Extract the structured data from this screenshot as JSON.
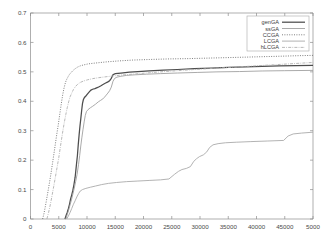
{
  "chart_data": {
    "type": "line",
    "title": "",
    "subtitle": "",
    "xlabel": "",
    "ylabel": "",
    "xlim": [
      0,
      50000
    ],
    "ylim": [
      0,
      0.7
    ],
    "grid": false,
    "legend_position": "top-right",
    "x_ticks": [
      0,
      5000,
      10000,
      15000,
      20000,
      25000,
      30000,
      35000,
      40000,
      45000,
      50000
    ],
    "x_tick_labels": [
      "0",
      "5000",
      "10000",
      "15000",
      "20000",
      "25000",
      "30000",
      "35000",
      "40000",
      "45000",
      "5000"
    ],
    "y_ticks": [
      0,
      0.1,
      0.2,
      0.3,
      0.4,
      0.5,
      0.6,
      0.7
    ],
    "y_tick_labels": [
      "0",
      "0.1",
      "0.2",
      "0.3",
      "0.4",
      "0.5",
      "0.6",
      "0.7"
    ],
    "series": [
      {
        "name": "genGA",
        "label": "genGA",
        "color": "#4d4d4d",
        "style": "solid",
        "width": 1.25,
        "dash": "",
        "points": [
          [
            6100,
            0.0
          ],
          [
            6300,
            0.012
          ],
          [
            6500,
            0.022
          ],
          [
            6700,
            0.035
          ],
          [
            6900,
            0.05
          ],
          [
            7100,
            0.068
          ],
          [
            7300,
            0.082
          ],
          [
            7500,
            0.098
          ],
          [
            7700,
            0.118
          ],
          [
            7900,
            0.142
          ],
          [
            8000,
            0.16
          ],
          [
            8150,
            0.188
          ],
          [
            8300,
            0.215
          ],
          [
            8450,
            0.252
          ],
          [
            8600,
            0.285
          ],
          [
            8750,
            0.315
          ],
          [
            8900,
            0.34
          ],
          [
            9050,
            0.368
          ],
          [
            9200,
            0.392
          ],
          [
            9350,
            0.405
          ],
          [
            9550,
            0.413
          ],
          [
            9800,
            0.418
          ],
          [
            10100,
            0.425
          ],
          [
            10400,
            0.432
          ],
          [
            10700,
            0.438
          ],
          [
            11000,
            0.441
          ],
          [
            11400,
            0.443
          ],
          [
            11900,
            0.447
          ],
          [
            12400,
            0.452
          ],
          [
            12900,
            0.458
          ],
          [
            13300,
            0.462
          ],
          [
            13700,
            0.466
          ],
          [
            14000,
            0.47
          ],
          [
            14300,
            0.478
          ],
          [
            14600,
            0.49
          ],
          [
            15000,
            0.494
          ],
          [
            16000,
            0.496
          ],
          [
            17500,
            0.499
          ],
          [
            19000,
            0.501
          ],
          [
            21000,
            0.503
          ],
          [
            23500,
            0.506
          ],
          [
            26000,
            0.508
          ],
          [
            29000,
            0.511
          ],
          [
            32000,
            0.513
          ],
          [
            35000,
            0.515
          ],
          [
            38000,
            0.517
          ],
          [
            41000,
            0.519
          ],
          [
            44000,
            0.52
          ],
          [
            47000,
            0.521
          ],
          [
            50000,
            0.522
          ]
        ]
      },
      {
        "name": "ssGA",
        "label": "ssGA",
        "color": "#9b9b9b",
        "style": "solid-thin",
        "width": 0.85,
        "dash": "",
        "points": [
          [
            6250,
            0.0
          ],
          [
            6500,
            0.015
          ],
          [
            6750,
            0.03
          ],
          [
            7000,
            0.048
          ],
          [
            7250,
            0.065
          ],
          [
            7500,
            0.085
          ],
          [
            7750,
            0.105
          ],
          [
            8000,
            0.128
          ],
          [
            8250,
            0.152
          ],
          [
            8500,
            0.185
          ],
          [
            8700,
            0.215
          ],
          [
            8900,
            0.248
          ],
          [
            9100,
            0.278
          ],
          [
            9300,
            0.305
          ],
          [
            9500,
            0.33
          ],
          [
            9700,
            0.352
          ],
          [
            9900,
            0.365
          ],
          [
            10200,
            0.372
          ],
          [
            10600,
            0.378
          ],
          [
            11000,
            0.383
          ],
          [
            11500,
            0.39
          ],
          [
            12000,
            0.398
          ],
          [
            12400,
            0.403
          ],
          [
            12800,
            0.408
          ],
          [
            13100,
            0.414
          ],
          [
            13400,
            0.421
          ],
          [
            13700,
            0.428
          ],
          [
            14000,
            0.436
          ],
          [
            14300,
            0.448
          ],
          [
            14600,
            0.468
          ],
          [
            14900,
            0.478
          ],
          [
            15300,
            0.482
          ],
          [
            16000,
            0.485
          ],
          [
            17000,
            0.488
          ],
          [
            18500,
            0.49
          ],
          [
            20500,
            0.492
          ],
          [
            23000,
            0.494
          ],
          [
            26000,
            0.496
          ],
          [
            29500,
            0.498
          ],
          [
            33000,
            0.5
          ],
          [
            37000,
            0.501
          ],
          [
            41000,
            0.503
          ],
          [
            45000,
            0.504
          ],
          [
            50000,
            0.505
          ]
        ]
      },
      {
        "name": "CCGA",
        "label": "CCGA",
        "color": "#707070",
        "style": "dotted",
        "width": 0.9,
        "dash": "1,1.4",
        "points": [
          [
            2150,
            0.0
          ],
          [
            2400,
            0.02
          ],
          [
            2650,
            0.045
          ],
          [
            2900,
            0.072
          ],
          [
            3150,
            0.1
          ],
          [
            3400,
            0.128
          ],
          [
            3650,
            0.158
          ],
          [
            3900,
            0.19
          ],
          [
            4150,
            0.222
          ],
          [
            4400,
            0.255
          ],
          [
            4650,
            0.288
          ],
          [
            4900,
            0.318
          ],
          [
            5100,
            0.345
          ],
          [
            5300,
            0.372
          ],
          [
            5500,
            0.398
          ],
          [
            5700,
            0.422
          ],
          [
            5900,
            0.442
          ],
          [
            6100,
            0.458
          ],
          [
            6300,
            0.47
          ],
          [
            6550,
            0.48
          ],
          [
            6850,
            0.49
          ],
          [
            7200,
            0.498
          ],
          [
            7600,
            0.506
          ],
          [
            8000,
            0.512
          ],
          [
            8400,
            0.517
          ],
          [
            8900,
            0.521
          ],
          [
            9500,
            0.524
          ],
          [
            10200,
            0.527
          ],
          [
            11000,
            0.529
          ],
          [
            12000,
            0.531
          ],
          [
            13500,
            0.534
          ],
          [
            15500,
            0.537
          ],
          [
            18000,
            0.54
          ],
          [
            21000,
            0.542
          ],
          [
            24500,
            0.544
          ],
          [
            28000,
            0.545
          ],
          [
            32000,
            0.547
          ],
          [
            36000,
            0.549
          ],
          [
            40000,
            0.551
          ],
          [
            44000,
            0.553
          ],
          [
            47500,
            0.555
          ],
          [
            50000,
            0.556
          ]
        ]
      },
      {
        "name": "LCGA",
        "label": "LCGA",
        "color": "#a5a5a5",
        "style": "solid-thin",
        "width": 0.85,
        "dash": "",
        "points": [
          [
            6400,
            0.0
          ],
          [
            6700,
            0.01
          ],
          [
            7000,
            0.022
          ],
          [
            7300,
            0.036
          ],
          [
            7600,
            0.05
          ],
          [
            7900,
            0.062
          ],
          [
            8200,
            0.075
          ],
          [
            8500,
            0.086
          ],
          [
            8800,
            0.095
          ],
          [
            9200,
            0.1
          ],
          [
            9800,
            0.104
          ],
          [
            10600,
            0.108
          ],
          [
            11500,
            0.112
          ],
          [
            12600,
            0.117
          ],
          [
            13800,
            0.121
          ],
          [
            15200,
            0.124
          ],
          [
            17000,
            0.127
          ],
          [
            19000,
            0.129
          ],
          [
            21000,
            0.131
          ],
          [
            23000,
            0.133
          ],
          [
            24500,
            0.136
          ],
          [
            25500,
            0.152
          ],
          [
            26200,
            0.162
          ],
          [
            26800,
            0.168
          ],
          [
            27600,
            0.172
          ],
          [
            28300,
            0.178
          ],
          [
            28900,
            0.196
          ],
          [
            29400,
            0.205
          ],
          [
            29900,
            0.212
          ],
          [
            30600,
            0.218
          ],
          [
            31200,
            0.228
          ],
          [
            31700,
            0.243
          ],
          [
            32300,
            0.252
          ],
          [
            33200,
            0.256
          ],
          [
            34500,
            0.259
          ],
          [
            36500,
            0.261
          ],
          [
            39000,
            0.263
          ],
          [
            42000,
            0.265
          ],
          [
            44800,
            0.267
          ],
          [
            45600,
            0.282
          ],
          [
            46500,
            0.289
          ],
          [
            48000,
            0.292
          ],
          [
            50000,
            0.295
          ]
        ]
      },
      {
        "name": "hLCGA",
        "label": "hLCGA",
        "color": "#b0b0b0",
        "style": "dash-dot",
        "width": 0.9,
        "dash": "3,1.2,0.8,1.2",
        "points": [
          [
            2900,
            0.0
          ],
          [
            3200,
            0.022
          ],
          [
            3500,
            0.048
          ],
          [
            3800,
            0.078
          ],
          [
            4100,
            0.11
          ],
          [
            4400,
            0.142
          ],
          [
            4700,
            0.175
          ],
          [
            5000,
            0.208
          ],
          [
            5250,
            0.24
          ],
          [
            5500,
            0.272
          ],
          [
            5750,
            0.302
          ],
          [
            6000,
            0.33
          ],
          [
            6250,
            0.355
          ],
          [
            6500,
            0.378
          ],
          [
            6750,
            0.398
          ],
          [
            7000,
            0.415
          ],
          [
            7300,
            0.428
          ],
          [
            7600,
            0.44
          ],
          [
            7950,
            0.45
          ],
          [
            8350,
            0.458
          ],
          [
            8800,
            0.464
          ],
          [
            9400,
            0.469
          ],
          [
            10100,
            0.473
          ],
          [
            11000,
            0.477
          ],
          [
            12000,
            0.48
          ],
          [
            13200,
            0.483
          ],
          [
            14600,
            0.486
          ],
          [
            16000,
            0.489
          ],
          [
            18000,
            0.492
          ],
          [
            20500,
            0.496
          ],
          [
            23000,
            0.5
          ],
          [
            26000,
            0.504
          ],
          [
            29000,
            0.508
          ],
          [
            32500,
            0.512
          ],
          [
            36000,
            0.516
          ],
          [
            39500,
            0.52
          ],
          [
            43000,
            0.524
          ],
          [
            46500,
            0.528
          ],
          [
            50000,
            0.532
          ]
        ]
      }
    ]
  }
}
